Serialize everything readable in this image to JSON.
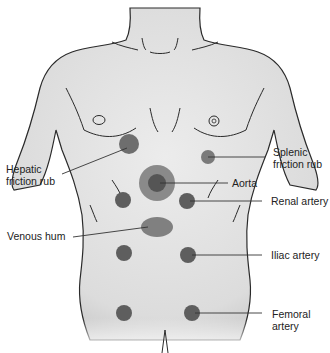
{
  "diagram": {
    "colors": {
      "skin": "#e6e6e6",
      "outline": "#2a2a2a",
      "site_dark": "#5e5e5e",
      "site_light": "#8a8a8a",
      "leader_line": "#333333",
      "label_text": "#222222"
    },
    "labels": {
      "hepatic": "Hepatic\nfriction rub",
      "splenic": "Splenic\nfriction rub",
      "aorta": "Aorta",
      "renal": "Renal artery",
      "venous": "Venous hum",
      "iliac": "Iliac artery",
      "femoral": "Femoral\nartery"
    },
    "sites": [
      {
        "name": "Hepatic friction rub",
        "side": "right upper quadrant"
      },
      {
        "name": "Splenic friction rub",
        "side": "left upper quadrant"
      },
      {
        "name": "Aorta",
        "side": "epigastric midline"
      },
      {
        "name": "Renal artery",
        "side": "bilateral, upper abdomen"
      },
      {
        "name": "Venous hum",
        "side": "periumbilical"
      },
      {
        "name": "Iliac artery",
        "side": "bilateral, lower abdomen"
      },
      {
        "name": "Femoral artery",
        "side": "bilateral, groin"
      }
    ]
  }
}
